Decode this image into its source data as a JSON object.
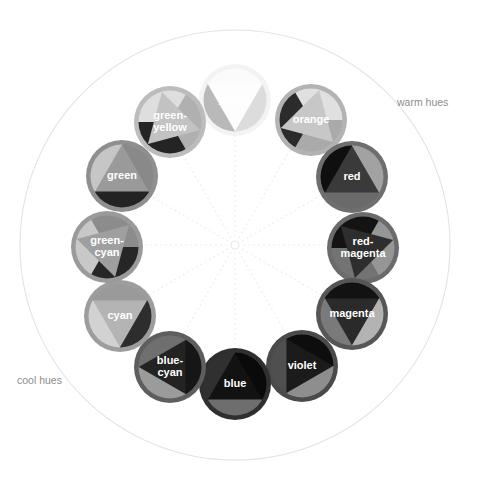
{
  "figure": {
    "center": {
      "x": 235,
      "y": 245
    },
    "outer_circle_radius": 215,
    "hub_radius": 4,
    "disc_ring_radius": 152,
    "spoke_color": "#ededed",
    "outer_ring_color": "#e3e3e3"
  },
  "zones": [
    {
      "name": "warm-hues",
      "label": "warm hues",
      "x": 397,
      "y": 103,
      "align": "right"
    },
    {
      "name": "cool-hues",
      "label": "cool hues",
      "x": 17,
      "y": 381,
      "align": "left"
    }
  ],
  "wheel": {
    "hue_count": 12,
    "hues": [
      {
        "key": "yellow",
        "label": "yellow",
        "angle_deg": 0,
        "cx": 235,
        "cy": 100,
        "r": 36,
        "ring_color": "#f3f3f3",
        "wedge_light": "#fbfbfb",
        "wedge_mid": "#dcdcdc",
        "wedge_dark": "#b9b9b9",
        "triangle_color": "#fdfdfd",
        "triangle_dir": "down",
        "label_color": "#efefef",
        "label_lines": [
          "yellow"
        ]
      },
      {
        "key": "orange",
        "label": "orange",
        "angle_deg": 30,
        "cx": 311,
        "cy": 120,
        "r": 36,
        "ring_color": "#b3b3b3",
        "wedge_light": "#e0e0e0",
        "wedge_mid": "#aaaaaa",
        "wedge_dark": "#2b2b2b",
        "triangle_color": "#c7c7c7",
        "triangle_dir": "right-down",
        "label_color": "#ffffff",
        "label_lines": [
          "orange"
        ]
      },
      {
        "key": "red",
        "label": "red",
        "angle_deg": 60,
        "cx": 352,
        "cy": 177,
        "r": 36,
        "ring_color": "#6e6e6e",
        "wedge_light": "#a2a2a2",
        "wedge_mid": "#6a6a6a",
        "wedge_dark": "#0f0f0f",
        "triangle_color": "#3a3a3a",
        "triangle_dir": "up",
        "label_color": "#ffffff",
        "label_lines": [
          "red"
        ]
      },
      {
        "key": "red-magenta",
        "label": "red-magenta",
        "angle_deg": 90,
        "cx": 363,
        "cy": 248,
        "r": 36,
        "ring_color": "#6b6b6b",
        "wedge_light": "#969696",
        "wedge_mid": "#737373",
        "wedge_dark": "#131313",
        "triangle_color": "#2e2e2e",
        "triangle_dir": "left-up",
        "label_color": "#ffffff",
        "label_lines": [
          "red-",
          "magenta"
        ]
      },
      {
        "key": "magenta",
        "label": "magenta",
        "angle_deg": 120,
        "cx": 352,
        "cy": 314,
        "r": 36,
        "ring_color": "#565656",
        "wedge_light": "#b3b3b3",
        "wedge_mid": "#7a7a7a",
        "wedge_dark": "#121212",
        "triangle_color": "#2a2a2a",
        "triangle_dir": "down",
        "label_color": "#ffffff",
        "label_lines": [
          "magenta"
        ]
      },
      {
        "key": "violet",
        "label": "violet",
        "angle_deg": 150,
        "cx": 302,
        "cy": 366,
        "r": 36,
        "ring_color": "#4a4a4a",
        "wedge_light": "#8e8e8e",
        "wedge_mid": "#4f4f4f",
        "wedge_dark": "#0d0d0d",
        "triangle_color": "#1b1b1b",
        "triangle_dir": "right",
        "label_color": "#ffffff",
        "label_lines": [
          "violet"
        ]
      },
      {
        "key": "blue",
        "label": "blue",
        "angle_deg": 180,
        "cx": 235,
        "cy": 384,
        "r": 36,
        "ring_color": "#2f2f2f",
        "wedge_light": "#6e6e6e",
        "wedge_mid": "#303030",
        "wedge_dark": "#0a0a0a",
        "triangle_color": "#121212",
        "triangle_dir": "up",
        "label_color": "#ffffff",
        "label_lines": [
          "blue"
        ]
      },
      {
        "key": "blue-cyan",
        "label": "blue-cyan",
        "angle_deg": 210,
        "cx": 170,
        "cy": 367,
        "r": 36,
        "ring_color": "#5e5e5e",
        "wedge_light": "#9b9b9b",
        "wedge_mid": "#6f6f6f",
        "wedge_dark": "#161616",
        "triangle_color": "#232323",
        "triangle_dir": "left",
        "label_color": "#ffffff",
        "label_lines": [
          "blue-",
          "cyan"
        ]
      },
      {
        "key": "cyan",
        "label": "cyan",
        "angle_deg": 240,
        "cx": 120,
        "cy": 316,
        "r": 36,
        "ring_color": "#9d9d9d",
        "wedge_light": "#d2d2d2",
        "wedge_mid": "#9a9a9a",
        "wedge_dark": "#2d2d2d",
        "triangle_color": "#b4b4b4",
        "triangle_dir": "down",
        "label_color": "#ffffff",
        "label_lines": [
          "cyan"
        ]
      },
      {
        "key": "green-cyan",
        "label": "green-cyan",
        "angle_deg": 270,
        "cx": 107,
        "cy": 247,
        "r": 36,
        "ring_color": "#9a9a9a",
        "wedge_light": "#c8c8c8",
        "wedge_mid": "#8c8c8c",
        "wedge_dark": "#262626",
        "triangle_color": "#9f9f9f",
        "triangle_dir": "right-up",
        "label_color": "#ffffff",
        "label_lines": [
          "green-",
          "cyan"
        ]
      },
      {
        "key": "green",
        "label": "green",
        "angle_deg": 300,
        "cx": 122,
        "cy": 176,
        "r": 36,
        "ring_color": "#8f8f8f",
        "wedge_light": "#c6c6c6",
        "wedge_mid": "#898989",
        "wedge_dark": "#232323",
        "triangle_color": "#9a9a9a",
        "triangle_dir": "up",
        "label_color": "#ffffff",
        "label_lines": [
          "green"
        ]
      },
      {
        "key": "green-yellow",
        "label": "green-yellow",
        "angle_deg": 330,
        "cx": 170,
        "cy": 122,
        "r": 36,
        "ring_color": "#bcbcbc",
        "wedge_light": "#dedede",
        "wedge_mid": "#b0b0b0",
        "wedge_dark": "#242424",
        "triangle_color": "#c2c2c2",
        "triangle_dir": "left-down",
        "label_color": "#ffffff",
        "label_lines": [
          "green-",
          "yellow"
        ]
      }
    ]
  },
  "chart_data": {
    "type": "pie",
    "categories": [
      "yellow",
      "orange",
      "red",
      "red-magenta",
      "magenta",
      "violet",
      "blue",
      "blue-cyan",
      "cyan",
      "green-cyan",
      "green",
      "green-yellow"
    ],
    "values": [
      30,
      30,
      30,
      30,
      30,
      30,
      30,
      30,
      30,
      30,
      30,
      30
    ],
    "angles_deg": [
      0,
      30,
      60,
      90,
      120,
      150,
      180,
      210,
      240,
      270,
      300,
      330
    ],
    "annotations": [
      "warm hues",
      "cool hues"
    ],
    "legend_position": "none",
    "grid": false,
    "xlabel": "",
    "ylabel": ""
  }
}
